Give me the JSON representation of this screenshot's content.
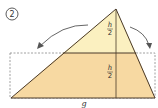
{
  "figure": {
    "step_number": "2",
    "labels": {
      "top_half_numerator": "h",
      "top_half_denominator": "2",
      "bottom_half_numerator": "h",
      "bottom_half_denominator": "2",
      "base": "g"
    },
    "colors": {
      "top_fill": "#fbf0c0",
      "bottom_fill": "#f7d9a2",
      "stroke": "#4a3a2a",
      "dashed": "#888888",
      "arrow": "#555555"
    }
  }
}
